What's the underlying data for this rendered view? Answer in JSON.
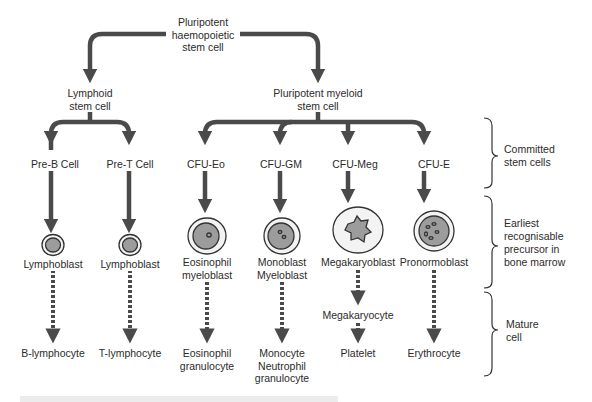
{
  "diagram": {
    "colors": {
      "line": "#4a4a4a",
      "cell_outer": "#f3f3f3",
      "cell_nucleus": "#9c9c9c",
      "cell_stroke": "#333333",
      "background": "#ffffff",
      "footer_bar": "#ececec"
    },
    "root": {
      "lines": [
        "Pluripotent",
        "haemopoietic",
        "stem cell"
      ]
    },
    "lymphoid": {
      "lines": [
        "Lymphoid",
        "stem cell"
      ]
    },
    "myeloid": {
      "lines": [
        "Pluripotent myeloid",
        "stem cell"
      ]
    },
    "columns": [
      {
        "committed": "Pre-B Cell",
        "precursor": [
          "Lymphoblast"
        ],
        "intermediate": null,
        "mature": [
          "B-lymphocyte"
        ],
        "cell_type": "lymphoblast"
      },
      {
        "committed": "Pre-T Cell",
        "precursor": [
          "Lymphoblast"
        ],
        "intermediate": null,
        "mature": [
          "T-lymphocyte"
        ],
        "cell_type": "lymphoblast"
      },
      {
        "committed": "CFU-Eo",
        "precursor": [
          "Eosinophil",
          "myeloblast"
        ],
        "intermediate": null,
        "mature": [
          "Eosinophil",
          "granulocyte"
        ],
        "cell_type": "eosinophil-myeloblast"
      },
      {
        "committed": "CFU-GM",
        "precursor": [
          "Monoblast",
          "Myeloblast"
        ],
        "intermediate": null,
        "mature": [
          "Monocyte",
          "Neutrophil",
          "granulocyte"
        ],
        "cell_type": "monoblast"
      },
      {
        "committed": "CFU-Meg",
        "precursor": [
          "Megakaryoblast"
        ],
        "intermediate": "Megakaryocyte",
        "mature": [
          "Platelet"
        ],
        "cell_type": "megakaryoblast"
      },
      {
        "committed": "CFU-E",
        "precursor": [
          "Pronormoblast"
        ],
        "intermediate": null,
        "mature": [
          "Erythrocyte"
        ],
        "cell_type": "pronormoblast"
      }
    ],
    "stages": [
      {
        "lines": [
          "Committed",
          "stem cells"
        ]
      },
      {
        "lines": [
          "Earliest",
          "recognisable",
          "precursor in",
          "bone marrow"
        ]
      },
      {
        "lines": [
          "Mature",
          "cell"
        ]
      }
    ]
  }
}
